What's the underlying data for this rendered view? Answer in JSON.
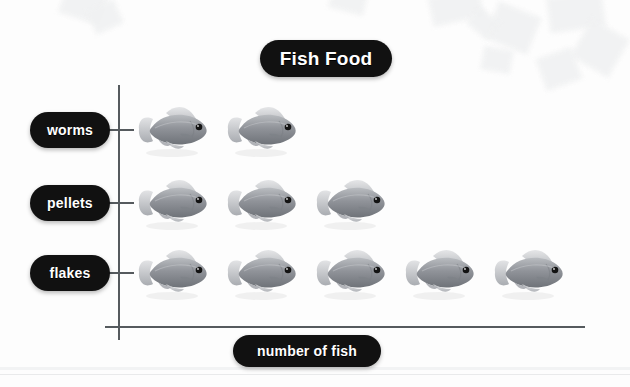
{
  "chart_data": {
    "type": "bar",
    "subtype": "pictograph",
    "title": "Fish Food",
    "xlabel": "number of fish",
    "ylabel": "",
    "categories": [
      "worms",
      "pellets",
      "flakes"
    ],
    "values": [
      2,
      3,
      5
    ],
    "icon": "fish-icon",
    "icon_unit_value": 1,
    "grid": false,
    "legend": "none",
    "orientation": "horizontal",
    "xlim": [
      0,
      6
    ],
    "tick_labels": [],
    "annotations": []
  },
  "chart": {
    "title": "Fish Food",
    "x_axis_label": "number of fish",
    "rows": [
      {
        "label": "worms",
        "count": 2
      },
      {
        "label": "pellets",
        "count": 3
      },
      {
        "label": "flakes",
        "count": 5
      }
    ]
  },
  "colors": {
    "pill_background": "#111111",
    "pill_text": "#ffffff",
    "axis": "#555a5e",
    "page_background": "#fdfdfd",
    "fish_body": "#8d9095",
    "fish_eye": "#111111"
  }
}
